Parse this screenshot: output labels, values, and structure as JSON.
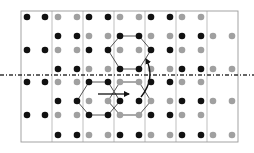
{
  "diagram": {
    "width": 254,
    "height": 153,
    "colors": {
      "black_atom": "#111111",
      "gray_atom": "#a0a0a0",
      "grid": "#b8b8b8",
      "border": "#9a9a9a",
      "mirror": "#333333",
      "hexagon": "#555555",
      "arrow": "#111111"
    },
    "dot_radius": 3.3,
    "frame": {
      "x1": 21,
      "y1": 11,
      "x2": 238,
      "y2": 142
    },
    "column_lines_x": [
      52,
      83,
      114,
      145,
      176,
      207
    ],
    "column_dot_x": [
      [
        27,
        45
      ],
      [
        58,
        77
      ],
      [
        89,
        108
      ],
      [
        120,
        139
      ],
      [
        151,
        170
      ],
      [
        182,
        201
      ],
      [
        213,
        232
      ]
    ],
    "rows": [
      {
        "y": 17,
        "cells": [
          "black",
          "gray",
          "black",
          "gray",
          "black",
          "gray",
          ""
        ]
      },
      {
        "y": 36,
        "cells": [
          "",
          "black",
          "gray",
          "black",
          "gray",
          "black",
          "gray"
        ]
      },
      {
        "y": 50,
        "cells": [
          "black",
          "gray",
          "black",
          "gray",
          "black",
          "gray",
          ""
        ]
      },
      {
        "y": 69,
        "cells": [
          "",
          "black",
          "gray",
          "black",
          "gray",
          "black",
          "gray"
        ]
      },
      {
        "y": 82,
        "cells": [
          "black",
          "gray",
          "black",
          "gray",
          "black",
          "gray",
          ""
        ]
      },
      {
        "y": 101,
        "cells": [
          "",
          "black",
          "gray",
          "black",
          "gray",
          "black",
          "gray"
        ]
      },
      {
        "y": 115,
        "cells": [
          "black",
          "gray",
          "black",
          "gray",
          "black",
          "gray",
          ""
        ]
      },
      {
        "y": 135,
        "cells": [
          "",
          "black",
          "gray",
          "black",
          "gray",
          "black",
          "gray"
        ]
      }
    ],
    "mirror_line": {
      "y": 75,
      "x1": 0,
      "x2": 254,
      "style": "dash-dot"
    },
    "hexagons": [
      {
        "name": "upper-black-hexagon",
        "points": [
          [
            120,
            36
          ],
          [
            139,
            36
          ],
          [
            151,
            50
          ],
          [
            139,
            69
          ],
          [
            120,
            69
          ],
          [
            108,
            50
          ]
        ]
      },
      {
        "name": "lower-black-hexagon",
        "points": [
          [
            89,
            82
          ],
          [
            108,
            82
          ],
          [
            120,
            101
          ],
          [
            108,
            115
          ],
          [
            89,
            115
          ],
          [
            77,
            101
          ]
        ]
      },
      {
        "name": "lower-gray-hexagon",
        "points": [
          [
            120,
            82
          ],
          [
            139,
            82
          ],
          [
            151,
            101
          ],
          [
            139,
            115
          ],
          [
            120,
            115
          ],
          [
            108,
            101
          ]
        ]
      }
    ],
    "translation_arrow": {
      "x1": 98,
      "y1": 94,
      "x2": 129,
      "y2": 94,
      "direction": "right"
    },
    "reflection_arc": {
      "path": "M 141 97 Q 156 78 146 59",
      "arrowhead": "up"
    }
  }
}
